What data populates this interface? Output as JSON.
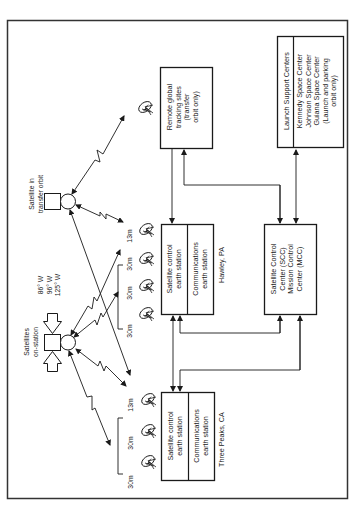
{
  "page_mark": "",
  "colors": {
    "ink": "#1a1a1a",
    "background": "#ffffff",
    "border": "#333333"
  },
  "satellites": {
    "transfer_orbit": {
      "label_line1": "Satellite in",
      "label_line2": "transfer orbit"
    },
    "on_station": {
      "label_line1": "Satellites",
      "label_line2": "on-station",
      "longitudes": [
        "86° W",
        "96° W",
        "125° W"
      ]
    }
  },
  "stations": {
    "remote_tracking": {
      "lines": [
        "Remote global",
        "tracking sites",
        "(transfer",
        "orbit only)"
      ]
    },
    "hawley": {
      "location": "Hawley, PA",
      "control": [
        "Satellite control",
        "earth station"
      ],
      "comms": [
        "Communications",
        "earth station"
      ],
      "antennas": [
        "30m",
        "30m",
        "30m",
        "13m"
      ]
    },
    "three_peaks": {
      "location": "Three Peaks, CA",
      "control": [
        "Satellite control",
        "earth station"
      ],
      "comms": [
        "Communications",
        "earth station"
      ],
      "antennas": [
        "30m",
        "30m",
        "13m"
      ]
    }
  },
  "control_center": {
    "lines": [
      "Satellite  Control",
      "Center (SCC)",
      "Mission Control",
      "Center (MCC)"
    ]
  },
  "launch_support": {
    "header": "Launch  Support Centers",
    "lines": [
      "Kennedy Space Center",
      "Johnson Space Center",
      "Guiana Space Center",
      "(Launch and parking",
      "orbit only)"
    ]
  }
}
